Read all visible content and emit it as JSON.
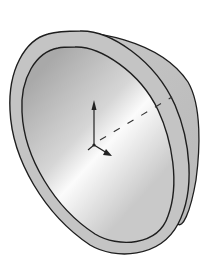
{
  "figure": {
    "view": "isometric",
    "colors": {
      "background": "#ffffff",
      "outline": "#1e1e1e",
      "rim_face": "#c4c4c4",
      "outer_surface": "#bdbdbd",
      "inner_surface_dark": "#a8a8a8",
      "inner_surface_light": "#fafafa",
      "axis": "#222222"
    },
    "triad": {
      "axes": [
        "y-axis",
        "x-axis",
        "z-axis"
      ],
      "labels_visible": false
    },
    "center_line": "dashed"
  }
}
